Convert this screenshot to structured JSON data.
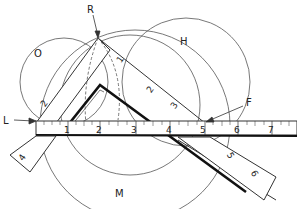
{
  "diagram": {
    "point_labels": {
      "R": "R",
      "L": "L",
      "F": "F"
    },
    "region_labels": {
      "O": "O",
      "H": "H",
      "M": "M"
    },
    "ruler_numbers": [
      "1",
      "2",
      "3",
      "4",
      "5",
      "6",
      "7"
    ],
    "left_square_numbers": [
      "1",
      "2",
      "4"
    ],
    "right_square_numbers": [
      "2",
      "3",
      "5",
      "6"
    ],
    "colors": {
      "line": "#333333",
      "thick_line": "#111111",
      "background": "#ffffff"
    }
  }
}
